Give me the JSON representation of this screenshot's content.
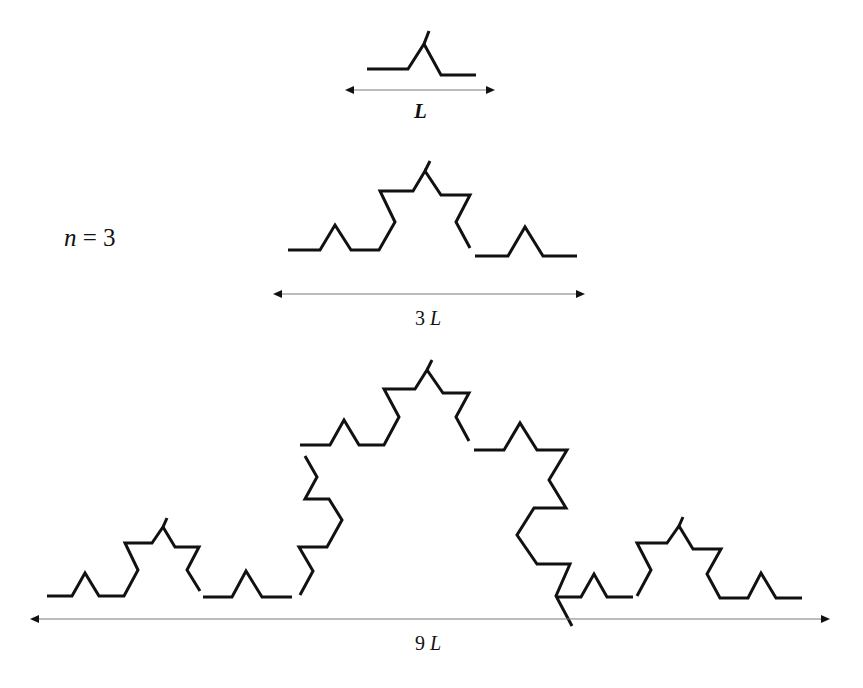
{
  "figure": {
    "iteration_label": {
      "var": "n",
      "eq": " = 3"
    },
    "levels": [
      {
        "name": "level-1",
        "scale_label": {
          "num": "",
          "unit": "L"
        },
        "paths": [
          [
            [
              367,
              69
            ],
            [
              408,
              69
            ],
            [
              424,
              44
            ],
            [
              441,
              75
            ],
            [
              476,
              75
            ]
          ],
          [
            [
              424,
              44
            ],
            [
              429,
              31
            ]
          ]
        ],
        "arrow": {
          "x1": 345,
          "x2": 495,
          "y": 90
        }
      },
      {
        "name": "level-2",
        "scale_label": {
          "num": "3 ",
          "unit": "L"
        },
        "paths": [
          [
            [
              288,
              250
            ],
            [
              320,
              250
            ],
            [
              335,
              225
            ],
            [
              351,
              250
            ],
            [
              379,
              250
            ],
            [
              395,
              222
            ],
            [
              380,
              191
            ],
            [
              413,
              191
            ],
            [
              425,
              171
            ],
            [
              441,
              195
            ],
            [
              470,
              195
            ],
            [
              456,
              222
            ],
            [
              470,
              248
            ]
          ],
          [
            [
              425,
              171
            ],
            [
              430,
              161
            ]
          ],
          [
            [
              475,
              256
            ],
            [
              508,
              256
            ],
            [
              525,
              227
            ],
            [
              543,
              256
            ],
            [
              577,
              256
            ]
          ]
        ],
        "arrow": {
          "x1": 273,
          "x2": 585,
          "y": 294
        }
      },
      {
        "name": "level-3",
        "scale_label": {
          "num": "9 ",
          "unit": "L"
        },
        "paths": [
          [
            [
              47,
              596
            ],
            [
              72,
              596
            ],
            [
              85,
              573
            ],
            [
              99,
              596
            ],
            [
              124,
              596
            ],
            [
              138,
              570
            ],
            [
              125,
              543
            ],
            [
              152,
              543
            ],
            [
              163,
              527
            ],
            [
              175,
              547
            ],
            [
              199,
              547
            ],
            [
              187,
              570
            ],
            [
              200,
              591
            ]
          ],
          [
            [
              163,
              527
            ],
            [
              167,
              518
            ]
          ],
          [
            [
              203,
              597
            ],
            [
              232,
              597
            ],
            [
              246,
              571
            ],
            [
              262,
              597
            ],
            [
              292,
              597
            ]
          ],
          [
            [
              300,
              595
            ],
            [
              313,
              571
            ],
            [
              299,
              547
            ],
            [
              327,
              547
            ],
            [
              342,
              520
            ],
            [
              329,
              499
            ],
            [
              305,
              499
            ],
            [
              317,
              477
            ],
            [
              305,
              456
            ]
          ],
          [
            [
              300,
              445
            ],
            [
              330,
              445
            ],
            [
              344,
              420
            ],
            [
              359,
              445
            ],
            [
              384,
              445
            ],
            [
              399,
              417
            ],
            [
              384,
              389
            ],
            [
              415,
              389
            ],
            [
              427,
              370
            ],
            [
              443,
              393
            ],
            [
              469,
              393
            ],
            [
              456,
              417
            ],
            [
              469,
              441
            ]
          ],
          [
            [
              427,
              370
            ],
            [
              432,
              360
            ]
          ],
          [
            [
              474,
              450
            ],
            [
              504,
              450
            ],
            [
              520,
              423
            ],
            [
              537,
              450
            ],
            [
              567,
              450
            ],
            [
              549,
              480
            ],
            [
              566,
              508
            ],
            [
              534,
              508
            ],
            [
              517,
              535
            ],
            [
              537,
              564
            ],
            [
              570,
              564
            ],
            [
              556,
              596
            ],
            [
              572,
              626
            ]
          ],
          [
            [
              556,
              597
            ],
            [
              581,
              597
            ],
            [
              594,
              574
            ],
            [
              607,
              597
            ],
            [
              633,
              597
            ]
          ],
          [
            [
              637,
              596
            ],
            [
              651,
              570
            ],
            [
              637,
              543
            ],
            [
              667,
              543
            ],
            [
              679,
              526
            ],
            [
              693,
              549
            ],
            [
              721,
              549
            ],
            [
              707,
              574
            ],
            [
              720,
              598
            ],
            [
              748,
              598
            ],
            [
              761,
              573
            ],
            [
              776,
              598
            ],
            [
              802,
              598
            ]
          ],
          [
            [
              679,
              526
            ],
            [
              683,
              517
            ]
          ]
        ],
        "arrow": {
          "x1": 30,
          "x2": 830,
          "y": 619
        }
      }
    ]
  },
  "colors": {
    "curve": "#111111",
    "arrow_line": "#7a7a7a",
    "background": "#ffffff"
  }
}
